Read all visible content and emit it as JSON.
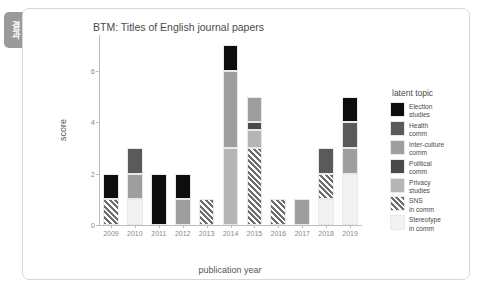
{
  "side_tab": {
    "label": "결과"
  },
  "chart_data": {
    "type": "bar",
    "stacked": true,
    "title": "BTM: Titles of English journal papers",
    "xlabel": "publication year",
    "ylabel": "score",
    "ylim": [
      0,
      7.4
    ],
    "yticks": [
      0,
      2,
      4,
      6
    ],
    "grid": false,
    "legend": {
      "title": "latent topic",
      "position": "right"
    },
    "categories": [
      "2009",
      "2010",
      "2011",
      "2012",
      "2013",
      "2014",
      "2015",
      "2016",
      "2017",
      "2018",
      "2019"
    ],
    "series": [
      {
        "name": "Election studies",
        "color": "#0d0d0d",
        "hatch": "none",
        "values": [
          1,
          0,
          2,
          1,
          0,
          1,
          0,
          0,
          0,
          0,
          1
        ]
      },
      {
        "name": "Health comm",
        "color": "#5a5a5a",
        "hatch": "none",
        "values": [
          0,
          1,
          0,
          0,
          0,
          0,
          0,
          0,
          0,
          1,
          1
        ]
      },
      {
        "name": "Inter-culture comm",
        "color": "#9e9e9e",
        "hatch": "none",
        "values": [
          0,
          1,
          0,
          1,
          0,
          3,
          1,
          0,
          1,
          0,
          1
        ]
      },
      {
        "name": "Political comm",
        "color": "#4a4a4a",
        "hatch": "none",
        "values": [
          0,
          0,
          0,
          0,
          0,
          0,
          0.3,
          0,
          0,
          0,
          0
        ]
      },
      {
        "name": "Privacy studies",
        "color": "#b5b5b5",
        "hatch": "none",
        "values": [
          0,
          0,
          0,
          0,
          0,
          3,
          0.7,
          0,
          0,
          0,
          0
        ]
      },
      {
        "name": "SNS in comm",
        "color": "#6e6e6e",
        "hatch": "lines",
        "values": [
          1,
          0,
          0,
          0,
          1,
          0,
          3,
          1,
          0,
          1,
          0
        ]
      },
      {
        "name": "Stereotype in comm",
        "color": "#f2f2f2",
        "hatch": "none",
        "values": [
          0,
          1,
          0,
          0,
          0,
          0,
          0,
          0,
          0,
          1,
          2
        ]
      }
    ],
    "totals": [
      2,
      3,
      2,
      2,
      1,
      7,
      6,
      1,
      1,
      3,
      5
    ]
  }
}
